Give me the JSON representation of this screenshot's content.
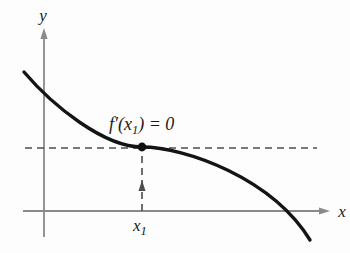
{
  "figure": {
    "background": "#fdfdfd",
    "colors": {
      "axis": "#8a8a8a",
      "dashed": "#4d4d4d",
      "curve": "#141414",
      "point": "#111111",
      "text": "#1a1a1a"
    },
    "labels": {
      "y_axis": "y",
      "x_axis": "x",
      "derivative_pre": "f′(x",
      "derivative_sub": "1",
      "derivative_post": ") = 0",
      "x1_base": "x",
      "x1_sub": "1"
    },
    "curve_path": "M 24 72 C 53 106 104 147 142 147 C 185 147 272 178 310 240"
  }
}
